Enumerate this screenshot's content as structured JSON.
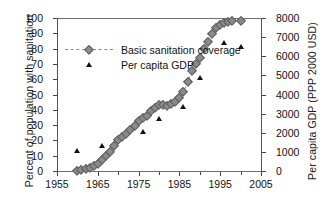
{
  "chart_data": {
    "type": "line",
    "title": "",
    "xlabel": "",
    "ylabel": "Percent of population with sanitation",
    "y2label": "Per capita GDP (PPP 2000 USD)",
    "xlim": [
      1955,
      2005
    ],
    "ylim": [
      0,
      100
    ],
    "y2lim": [
      0,
      8000
    ],
    "grid": false,
    "legend_position": "upper-left-inside",
    "xticks": [
      1955,
      1965,
      1975,
      1985,
      1995,
      2005
    ],
    "xticklabels": [
      "1955",
      "1965",
      "1975",
      "1985",
      "1995",
      "2005"
    ],
    "xticks_minor": [
      1960,
      1970,
      1980,
      1990,
      2000
    ],
    "yticks": [
      0,
      10,
      20,
      30,
      40,
      50,
      60,
      70,
      80,
      90,
      100
    ],
    "yticklabels": [
      "0",
      "10",
      "20",
      "30",
      "40",
      "50",
      "60",
      "70",
      "80",
      "90",
      "100"
    ],
    "y2ticks": [
      0,
      1000,
      2000,
      3000,
      4000,
      5000,
      6000,
      7000,
      8000
    ],
    "y2ticklabels": [
      "0",
      "1000",
      "2000",
      "3000",
      "4000",
      "5000",
      "6000",
      "7000",
      "8000"
    ],
    "series": [
      {
        "name": "Basic sanitation coverage",
        "type": "line",
        "axis": "left",
        "marker": "diamond",
        "linestyle": "dashed",
        "color": "#8a8a8a",
        "units": "percent",
        "points": [
          {
            "x": 1960,
            "y": 0.3
          },
          {
            "x": 1961,
            "y": 0.5
          },
          {
            "x": 1962,
            "y": 1.0
          },
          {
            "x": 1963,
            "y": 2.0
          },
          {
            "x": 1964,
            "y": 3.2
          },
          {
            "x": 1965,
            "y": 4.6
          },
          {
            "x": 1966,
            "y": 7.0
          },
          {
            "x": 1967,
            "y": 9.5
          },
          {
            "x": 1968,
            "y": 12.5
          },
          {
            "x": 1969,
            "y": 16.5
          },
          {
            "x": 1970,
            "y": 20.3
          },
          {
            "x": 1971,
            "y": 22.5
          },
          {
            "x": 1972,
            "y": 24.5
          },
          {
            "x": 1973,
            "y": 26.5
          },
          {
            "x": 1974,
            "y": 29.5
          },
          {
            "x": 1975,
            "y": 32.5
          },
          {
            "x": 1976,
            "y": 34.5
          },
          {
            "x": 1977,
            "y": 36.0
          },
          {
            "x": 1978,
            "y": 39.5
          },
          {
            "x": 1979,
            "y": 41.0
          },
          {
            "x": 1980,
            "y": 43.0
          },
          {
            "x": 1981,
            "y": 43.0
          },
          {
            "x": 1982,
            "y": 42.7
          },
          {
            "x": 1983,
            "y": 44.0
          },
          {
            "x": 1984,
            "y": 45.3
          },
          {
            "x": 1985,
            "y": 47.5
          },
          {
            "x": 1986,
            "y": 51.5
          },
          {
            "x": 1987,
            "y": 58.0
          },
          {
            "x": 1988,
            "y": 65.5
          },
          {
            "x": 1989,
            "y": 70.0
          },
          {
            "x": 1990,
            "y": 74.0
          },
          {
            "x": 1991,
            "y": 79.5
          },
          {
            "x": 1992,
            "y": 84.5
          },
          {
            "x": 1993,
            "y": 89.5
          },
          {
            "x": 1994,
            "y": 93.5
          },
          {
            "x": 1995,
            "y": 95.5
          },
          {
            "x": 1996,
            "y": 97.0
          },
          {
            "x": 1997,
            "y": 97.5
          },
          {
            "x": 1998,
            "y": 98.2
          },
          {
            "x": 2000,
            "y": 98.2
          }
        ]
      },
      {
        "name": "Per capita GDP",
        "type": "scatter",
        "axis": "right",
        "marker": "triangle",
        "color": "#111111",
        "units": "PPP 2000 USD",
        "points": [
          {
            "x": 1960,
            "y": 1050
          },
          {
            "x": 1966,
            "y": 1300
          },
          {
            "x": 1976,
            "y": 2050
          },
          {
            "x": 1980,
            "y": 2700
          },
          {
            "x": 1986,
            "y": 3350
          },
          {
            "x": 1990,
            "y": 4850
          },
          {
            "x": 1996,
            "y": 6700
          },
          {
            "x": 2000,
            "y": 6500
          }
        ]
      }
    ],
    "legend": [
      {
        "label": "Basic sanitation coverage",
        "marker": "diamond-dashed-line",
        "color": "#8a8a8a"
      },
      {
        "label": "Per capita GDP",
        "marker": "triangle",
        "color": "#111111"
      }
    ]
  }
}
